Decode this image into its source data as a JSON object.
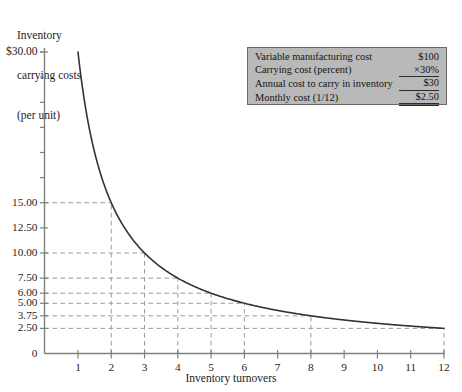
{
  "chart_data": {
    "type": "line",
    "title": "",
    "ylabel": "Inventory carrying costs (per unit)",
    "xlabel": "Inventory turnovers",
    "formula": "carrying cost = 30 / turnovers",
    "xlim": [
      0,
      12
    ],
    "ylim": [
      0,
      30
    ],
    "grid": true,
    "legend_position": "top-right",
    "x": [
      1,
      2,
      3,
      4,
      5,
      6,
      8,
      12
    ],
    "values": [
      30.0,
      15.0,
      10.0,
      7.5,
      6.0,
      5.0,
      3.75,
      2.5
    ],
    "labeled_points": [
      {
        "x": 2,
        "y": 15.0,
        "label": "15.00"
      },
      {
        "x": 3,
        "y": 10.0,
        "label": "10.00"
      },
      {
        "x": 4,
        "y": 7.5,
        "label": "7.50"
      },
      {
        "x": 5,
        "y": 6.0,
        "label": "6.00"
      },
      {
        "x": 6,
        "y": 5.0,
        "label": "5.00"
      },
      {
        "x": 8,
        "y": 3.75,
        "label": "3.75"
      },
      {
        "x": 12,
        "y": 2.5,
        "label": "2.50"
      }
    ],
    "y_tick_labels": [
      "$30.00",
      "15.00",
      "12.50",
      "10.00",
      "7.50",
      "6.00",
      "5.00",
      "3.75",
      "2.50",
      "0"
    ],
    "y_tick_values": [
      30.0,
      15.0,
      12.5,
      10.0,
      7.5,
      6.0,
      5.0,
      3.75,
      2.5,
      0
    ],
    "y_minor_tick_values": [
      27.5,
      25.0,
      22.5,
      20.0,
      17.5
    ],
    "x_tick_labels": [
      "1",
      "2",
      "3",
      "4",
      "5",
      "6",
      "7",
      "8",
      "9",
      "10",
      "11",
      "12"
    ],
    "x_tick_values": [
      1,
      2,
      3,
      4,
      5,
      6,
      7,
      8,
      9,
      10,
      11,
      12
    ],
    "series_color": "#333333",
    "grid_color": "#9a9a9a",
    "axis_color": "#808080"
  },
  "y_axis_title": {
    "line1": "Inventory",
    "line2": "carrying costs",
    "line3": "(per unit)"
  },
  "x_axis_title": "Inventory turnovers",
  "legend": {
    "background_color": "#b9b9b9",
    "border_color": "#6a6a6a",
    "rows": [
      {
        "label": "Variable manufacturing cost",
        "value": "$100"
      },
      {
        "label": "Carrying cost (percent)",
        "value": "×30%"
      },
      {
        "label": "Annual cost to carry in inventory",
        "value": "$30"
      },
      {
        "label": "Monthly cost (1/12)",
        "value": "$2.50"
      }
    ]
  }
}
